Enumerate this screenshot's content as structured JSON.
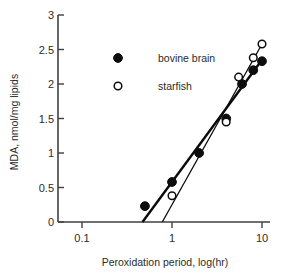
{
  "chart_data": {
    "type": "scatter",
    "title": "",
    "xlabel": "Peroxidation period, log(hr)",
    "ylabel": "MDA, nmol/mg lipids",
    "xscale": "log",
    "yscale": "linear",
    "xlim": [
      0.1,
      10
    ],
    "ylim": [
      0,
      3
    ],
    "xticks": [
      0.1,
      1,
      10
    ],
    "xtick_labels": [
      "0.1",
      "1",
      "10"
    ],
    "yticks": [
      0,
      0.5,
      1,
      1.5,
      2,
      2.5,
      3
    ],
    "ytick_labels": [
      "0",
      "0.5",
      "1",
      "1.5",
      "2",
      "2.5",
      "3"
    ],
    "grid": false,
    "legend_position": "upper-left-inside",
    "series": [
      {
        "name": "bovine brain",
        "marker": "filled-circle",
        "color": "#0d0d0d",
        "points": [
          {
            "x": 0.5,
            "y": 0.23
          },
          {
            "x": 1.0,
            "y": 0.58
          },
          {
            "x": 2.0,
            "y": 1.0
          },
          {
            "x": 4.0,
            "y": 1.5
          },
          {
            "x": 6.0,
            "y": 2.0
          },
          {
            "x": 8.0,
            "y": 2.2
          },
          {
            "x": 10.0,
            "y": 2.33
          }
        ],
        "fit_line": {
          "x_start": 0.47,
          "y_start": 0.0,
          "x_end": 10.4,
          "y_end": 2.38
        }
      },
      {
        "name": "starfish",
        "marker": "open-circle",
        "color": "#0d0d0d",
        "points": [
          {
            "x": 1.0,
            "y": 0.38
          },
          {
            "x": 4.0,
            "y": 1.45
          },
          {
            "x": 5.5,
            "y": 2.1
          },
          {
            "x": 8.0,
            "y": 2.38
          },
          {
            "x": 10.0,
            "y": 2.58
          }
        ],
        "fit_line": {
          "x_start": 0.78,
          "y_start": 0.0,
          "x_end": 10.4,
          "y_end": 2.62
        }
      }
    ]
  },
  "legend": {
    "entries": [
      {
        "label": "bovine brain",
        "marker": "filled-circle"
      },
      {
        "label": "starfish",
        "marker": "open-circle"
      }
    ]
  }
}
